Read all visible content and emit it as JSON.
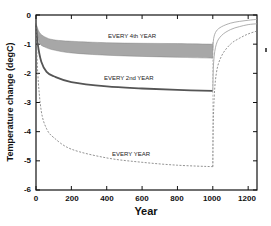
{
  "chart_data": {
    "type": "line",
    "title": "",
    "xlabel": "Year",
    "ylabel": "Temperature change  (degC)",
    "xlim": [
      0,
      1250
    ],
    "ylim": [
      -6,
      0
    ],
    "xticks": [
      0,
      200,
      400,
      600,
      800,
      1000,
      1200
    ],
    "yticks": [
      0,
      -1,
      -2,
      -3,
      -4,
      -5,
      -6
    ],
    "grid": false,
    "legend": "inline labels",
    "series": [
      {
        "name": "EVERY 4th YEAR",
        "style": "shaded band (oscillating)",
        "color": "#8a8a8a",
        "x": [
          0,
          20,
          50,
          100,
          200,
          400,
          600,
          800,
          1000
        ],
        "upper": [
          -0.3,
          -0.6,
          -0.75,
          -0.85,
          -0.9,
          -0.95,
          -0.97,
          -0.98,
          -1.0
        ],
        "lower": [
          -0.4,
          -0.95,
          -1.1,
          -1.2,
          -1.3,
          -1.38,
          -1.42,
          -1.45,
          -1.48
        ]
      },
      {
        "name": "EVERY 2nd YEAR",
        "style": "solid thick",
        "color": "#555555",
        "x": [
          0,
          10,
          30,
          60,
          100,
          200,
          400,
          600,
          800,
          1000
        ],
        "values": [
          -0.3,
          -1.0,
          -1.6,
          -1.95,
          -2.1,
          -2.3,
          -2.45,
          -2.52,
          -2.57,
          -2.6
        ]
      },
      {
        "name": "EVERY YEAR",
        "style": "dashed",
        "color": "#777777",
        "x": [
          0,
          10,
          30,
          60,
          100,
          200,
          400,
          600,
          800,
          1000
        ],
        "values": [
          -0.3,
          -2.0,
          -3.3,
          -3.9,
          -4.2,
          -4.6,
          -4.9,
          -5.05,
          -5.15,
          -5.2
        ]
      },
      {
        "name": "recovery (after EVERY 4th YEAR)",
        "style": "thin solid",
        "color": "#9a9a9a",
        "x": [
          1000,
          1005,
          1020,
          1050,
          1100,
          1150,
          1200,
          1250
        ],
        "values": [
          -1.2,
          -0.8,
          -0.55,
          -0.4,
          -0.28,
          -0.22,
          -0.18,
          -0.15
        ]
      },
      {
        "name": "recovery (after EVERY 2nd YEAR)",
        "style": "thin solid",
        "color": "#9a9a9a",
        "x": [
          1000,
          1005,
          1020,
          1050,
          1100,
          1150,
          1200,
          1250
        ],
        "values": [
          -2.6,
          -1.6,
          -1.0,
          -0.7,
          -0.5,
          -0.4,
          -0.33,
          -0.3
        ]
      },
      {
        "name": "recovery (after EVERY YEAR)",
        "style": "thin dashed",
        "color": "#777777",
        "x": [
          1000,
          1005,
          1020,
          1050,
          1100,
          1150,
          1200,
          1250
        ],
        "values": [
          -5.2,
          -3.2,
          -2.0,
          -1.4,
          -1.0,
          -0.8,
          -0.65,
          -0.55
        ]
      }
    ],
    "annotations": [
      "EVERY 4th YEAR",
      "EVERY 2nd YEAR",
      "EVERY YEAR"
    ]
  },
  "axis": {
    "x_title": "Year",
    "y_title": "Temperature change  (degC)",
    "x_tick_labels": [
      "0",
      "200",
      "400",
      "600",
      "800",
      "1000",
      "1200"
    ],
    "y_tick_labels": [
      "0",
      "-1",
      "-2",
      "-3",
      "-4",
      "-5",
      "-6"
    ]
  },
  "labels": {
    "every4": "EVERY 4th YEAR",
    "every2": "EVERY 2nd YEAR",
    "every1": "EVERY YEAR"
  }
}
